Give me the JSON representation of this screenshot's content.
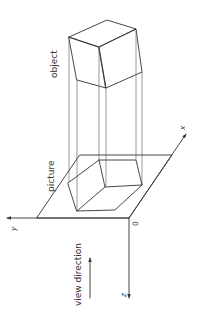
{
  "diagram": {
    "title": "",
    "labels": {
      "object": "object",
      "picture": "picture",
      "view_direction": "view direction",
      "x_axis": "x",
      "y_axis": "y",
      "z_axis": "z",
      "origin": "0"
    }
  }
}
